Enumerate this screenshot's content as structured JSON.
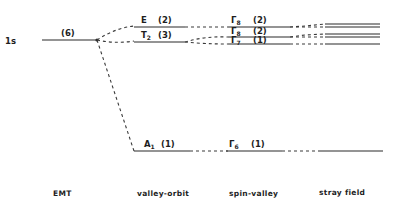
{
  "diagram": {
    "type": "energy-level splitting diagram",
    "columns": [
      {
        "id": "emt",
        "label": "EMT"
      },
      {
        "id": "valley_orbit",
        "label": "valley-orbit"
      },
      {
        "id": "spin_valley",
        "label": "spin-valley"
      },
      {
        "id": "stray_field",
        "label": "stray field"
      }
    ],
    "levels": {
      "emt": [
        {
          "name": "1s",
          "degeneracy": "(6)"
        }
      ],
      "valley_orbit": [
        {
          "name": "E",
          "sub": "",
          "degeneracy": "(2)"
        },
        {
          "name": "T",
          "sub": "2",
          "degeneracy": "(3)"
        },
        {
          "name": "A",
          "sub": "1",
          "degeneracy": "(1)"
        }
      ],
      "spin_valley": [
        {
          "name": "Γ",
          "sub": "8",
          "degeneracy": "(2)"
        },
        {
          "name": "Γ",
          "sub": "8",
          "degeneracy": "(2)"
        },
        {
          "name": "Γ",
          "sub": "7",
          "degeneracy": "(1)"
        },
        {
          "name": "Γ",
          "sub": "6",
          "degeneracy": "(1)"
        }
      ],
      "stray_field": {
        "line_count": 6,
        "groups": [
          2,
          2,
          1,
          1
        ]
      }
    },
    "colors": {
      "line": "#2a2a2a",
      "text": "#1e1e1e",
      "background": "#ffffff"
    }
  }
}
